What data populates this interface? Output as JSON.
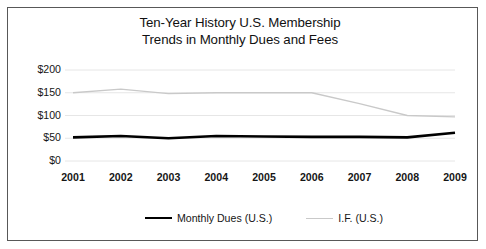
{
  "chart_data": {
    "type": "line",
    "title": "Ten-Year History U.S. Membership Trends in Monthly Dues and Fees",
    "title_lines": [
      "Ten-Year History U.S. Membership",
      "Trends in Monthly Dues and Fees"
    ],
    "xlabel": "",
    "ylabel": "",
    "categories": [
      "2001",
      "2002",
      "2003",
      "2004",
      "2005",
      "2006",
      "2007",
      "2008",
      "2009"
    ],
    "ylim": [
      0,
      200
    ],
    "yticks": [
      0,
      50,
      100,
      150,
      200
    ],
    "ytick_labels": [
      "$0",
      "$50",
      "$100",
      "$150",
      "$200"
    ],
    "grid": "horizontal",
    "legend_position": "bottom",
    "series": [
      {
        "name": "Monthly Dues (U.S.)",
        "color": "#000000",
        "width": 2.6,
        "values": [
          52,
          55,
          50,
          55,
          54,
          53,
          53,
          52,
          62
        ]
      },
      {
        "name": "I.F. (U.S.)",
        "color": "#c9c9c9",
        "width": 1.4,
        "values": [
          150,
          158,
          148,
          150,
          150,
          150,
          126,
          100,
          97
        ]
      }
    ]
  },
  "figure": {
    "border_color": "#585858",
    "background": "#ffffff",
    "gridline_color": "#e6e6e6"
  }
}
